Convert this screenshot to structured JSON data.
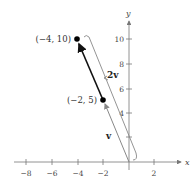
{
  "diagram": {
    "type": "vector-scalar-multiple-plot",
    "axes": {
      "x_label": "x",
      "y_label": "y",
      "x_ticks": [
        {
          "value": -8,
          "label": "−8"
        },
        {
          "value": -6,
          "label": "−6"
        },
        {
          "value": -4,
          "label": "−4"
        },
        {
          "value": -2,
          "label": "−2"
        },
        {
          "value": 2,
          "label": "2"
        }
      ],
      "y_ticks": [
        {
          "value": 2,
          "label": ""
        },
        {
          "value": 4,
          "label": "4"
        },
        {
          "value": 6,
          "label": "6"
        },
        {
          "value": 8,
          "label": "8"
        },
        {
          "value": 10,
          "label": "10"
        }
      ],
      "xlim": [
        -9,
        3
      ],
      "ylim": [
        0,
        11
      ]
    },
    "points": [
      {
        "name": "tip-2v",
        "x": -4,
        "y": 10,
        "label": "(−4, 10)"
      },
      {
        "name": "tip-v",
        "x": -2,
        "y": 5,
        "label": "(−2, 5)"
      }
    ],
    "vectors": [
      {
        "name": "v",
        "label": "v",
        "from": [
          0,
          0
        ],
        "to": [
          -2,
          5
        ],
        "color": "#888888"
      },
      {
        "name": "2v",
        "label": "2v",
        "from": [
          0,
          0
        ],
        "to": [
          -4,
          10
        ],
        "color": "#111111"
      }
    ],
    "colors": {
      "axis": "#777777",
      "vector_v": "#888888",
      "vector_2v": "#111111",
      "bracket": "#888888",
      "point": "#000000"
    }
  }
}
